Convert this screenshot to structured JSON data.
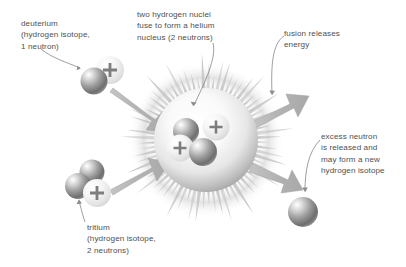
{
  "figure": {
    "width": 406,
    "height": 267,
    "background": "#ffffff"
  },
  "captions": {
    "deuterium": "deuterium\n(hydrogen isotope,\n1 neutron)",
    "fusion_nuclei": "two hydrogen nuclei\nfuse to form a helium\nnucleus (2 neutrons)",
    "fusion_energy": "fusion releases\nenergy",
    "excess_neutron": "excess neutron\nis released and\nmay form a new\nhydrogen isotope",
    "tritium": "tritium\n(hydrogen isotope,\n2 neutrons)"
  },
  "particles": {
    "proton_symbol": "+",
    "deuterium": {
      "neutrons": 1,
      "protons": 1
    },
    "tritium": {
      "neutrons": 2,
      "protons": 1
    },
    "helium_nucleus": {
      "neutrons": 2,
      "protons": 2
    },
    "released": {
      "neutrons": 1
    }
  },
  "colors": {
    "text": "#504f4f",
    "leader_line": "#8a8a8a",
    "motion_arrow": "#b3b3b3",
    "motion_arrow_edge": "#9a9a9a",
    "neutron_dark": "#6f6f6f",
    "neutron_light": "#e9e9e9",
    "proton_fill": "#f2f2f2",
    "burst_ray": "#cfcfcf",
    "burst_glow": "#dcdcdc"
  }
}
